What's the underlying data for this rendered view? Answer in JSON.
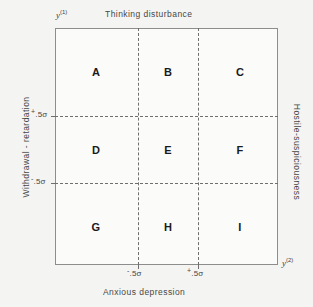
{
  "figure": {
    "caption_top": "Thinking disturbance",
    "caption_bottom": "Anxious depression",
    "caption_left": "Withdrawal - retardation",
    "caption_right": "Hostile-suspiciousness"
  },
  "axes": {
    "vertical": {
      "variable": "y",
      "superscript": "(1)"
    },
    "horizontal": {
      "variable": "y",
      "superscript": "(2)"
    },
    "y_ticks": [
      {
        "sign": "+",
        "value": ".5σ"
      },
      {
        "sign": "-",
        "value": ".5σ"
      }
    ],
    "x_ticks": [
      {
        "sign": "-",
        "value": ".5σ"
      },
      {
        "sign": "+",
        "value": ".5σ"
      }
    ]
  },
  "grid": {
    "rows": 3,
    "cols": 3,
    "cells": [
      {
        "id": "A",
        "label": "A",
        "row": 0,
        "col": 0
      },
      {
        "id": "B",
        "label": "B",
        "row": 0,
        "col": 1
      },
      {
        "id": "C",
        "label": "C",
        "row": 0,
        "col": 2
      },
      {
        "id": "D",
        "label": "D",
        "row": 1,
        "col": 0
      },
      {
        "id": "E",
        "label": "E",
        "row": 1,
        "col": 1
      },
      {
        "id": "F",
        "label": "F",
        "row": 1,
        "col": 2
      },
      {
        "id": "G",
        "label": "G",
        "row": 2,
        "col": 0
      },
      {
        "id": "H",
        "label": "H",
        "row": 2,
        "col": 1
      },
      {
        "id": "I",
        "label": "I",
        "row": 2,
        "col": 2
      }
    ]
  },
  "colors": {
    "background": "#f4f4f2",
    "plot_background": "#fbfbfa",
    "frame": "#8d8d8d",
    "grid_line": "#6f6f6f",
    "text": "#474747",
    "cell_text": "#1a1a1a"
  }
}
